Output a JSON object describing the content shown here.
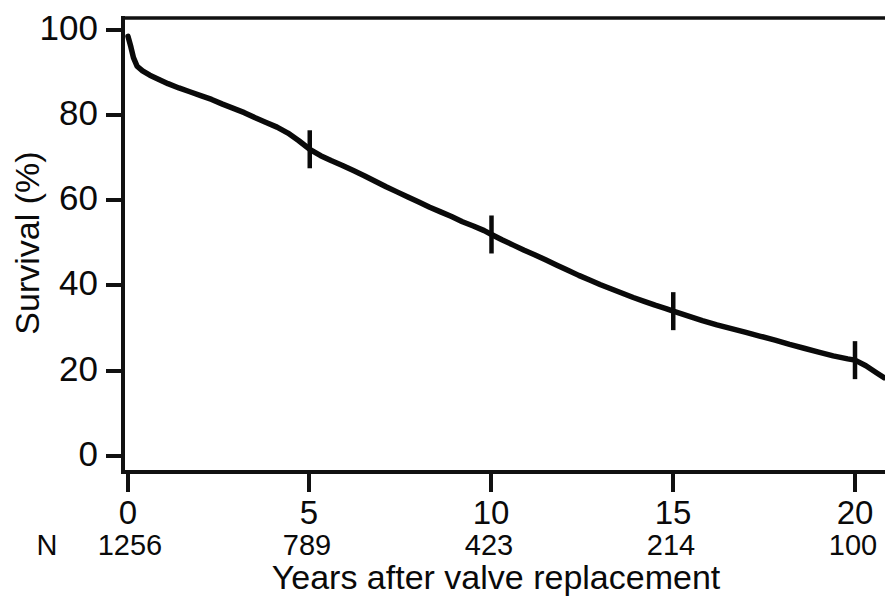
{
  "chart_data": {
    "type": "line",
    "title": "",
    "subtitle": "",
    "xlabel": "Years after valve replacement",
    "ylabel": "Survival (%)",
    "xlim": [
      0,
      20.8
    ],
    "ylim": [
      0,
      100
    ],
    "grid": false,
    "legend": "none",
    "x_ticks": [
      0,
      5,
      10,
      15,
      20
    ],
    "x_tick_labels": [
      "0",
      "5",
      "10",
      "15",
      "20"
    ],
    "y_ticks": [
      0,
      20,
      40,
      60,
      80,
      100
    ],
    "y_tick_labels": [
      "0",
      "20",
      "40",
      "60",
      "80",
      "100"
    ],
    "risk_table": {
      "row_label": "N",
      "times": [
        0,
        5,
        10,
        15,
        20
      ],
      "counts": [
        "1256",
        "789",
        "423",
        "214",
        "100"
      ]
    },
    "censor_marks": [
      {
        "x": 5,
        "y": 72
      },
      {
        "x": 10,
        "y": 52
      },
      {
        "x": 15,
        "y": 34
      },
      {
        "x": 20,
        "y": 22.5
      }
    ],
    "series": [
      {
        "name": "Overall survival after valve replacement",
        "color": "#0a0a0a",
        "x": [
          0,
          0.08,
          0.15,
          0.25,
          0.4,
          0.6,
          0.85,
          1.1,
          1.4,
          1.7,
          2.0,
          2.3,
          2.6,
          2.9,
          3.2,
          3.5,
          3.8,
          4.1,
          4.4,
          4.7,
          5.0,
          5.3,
          5.6,
          5.9,
          6.2,
          6.5,
          6.8,
          7.1,
          7.4,
          7.7,
          8.0,
          8.3,
          8.6,
          8.9,
          9.2,
          9.5,
          9.8,
          10.0,
          10.3,
          10.6,
          10.9,
          11.2,
          11.5,
          11.8,
          12.1,
          12.4,
          12.7,
          13.0,
          13.3,
          13.6,
          13.9,
          14.2,
          14.5,
          14.8,
          15.0,
          15.4,
          15.8,
          16.2,
          16.6,
          17.0,
          17.4,
          17.8,
          18.2,
          18.6,
          19.0,
          19.4,
          19.8,
          20.0,
          20.3,
          20.6,
          20.8
        ],
        "y": [
          98.5,
          96.0,
          93.5,
          91.5,
          90.4,
          89.4,
          88.4,
          87.4,
          86.4,
          85.5,
          84.6,
          83.7,
          82.6,
          81.6,
          80.6,
          79.4,
          78.3,
          77.2,
          75.8,
          74.0,
          72.0,
          70.5,
          69.3,
          68.2,
          67.0,
          65.8,
          64.5,
          63.2,
          62.0,
          60.8,
          59.6,
          58.4,
          57.3,
          56.2,
          55.0,
          54.0,
          52.9,
          52.0,
          50.7,
          49.5,
          48.3,
          47.2,
          46.0,
          44.8,
          43.6,
          42.4,
          41.3,
          40.2,
          39.2,
          38.2,
          37.2,
          36.3,
          35.4,
          34.6,
          34.0,
          32.9,
          31.8,
          30.8,
          29.9,
          29.0,
          28.1,
          27.2,
          26.2,
          25.3,
          24.4,
          23.5,
          22.8,
          22.5,
          21.2,
          19.5,
          18.4
        ]
      }
    ]
  }
}
